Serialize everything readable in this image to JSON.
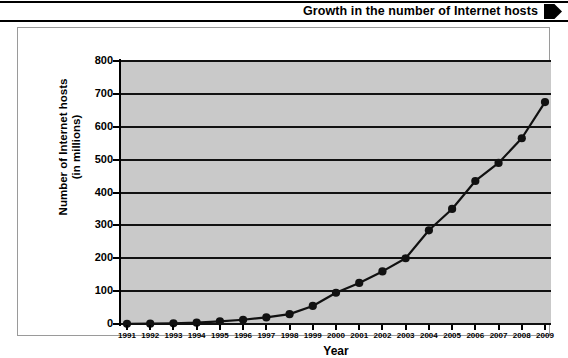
{
  "title": {
    "text": "Growth in the number of Internet hosts",
    "arrow_icon": "right-arrow-marker"
  },
  "chart_data": {
    "type": "line",
    "title": "Growth in the number of Internet hosts",
    "xlabel": "Year",
    "ylabel": "Number of Internet hosts (in millions)",
    "ylabel_line1": "Number of Internet hosts",
    "ylabel_line2": "(in millions)",
    "categories": [
      "1991",
      "1992",
      "1993",
      "1994",
      "1995",
      "1996",
      "1997",
      "1998",
      "1999",
      "2000",
      "2001",
      "2002",
      "2003",
      "2004",
      "2005",
      "2006",
      "2007",
      "2008",
      "2009"
    ],
    "values": [
      0.6,
      1,
      2,
      4,
      8,
      13,
      20,
      30,
      55,
      95,
      125,
      160,
      200,
      285,
      350,
      435,
      490,
      565,
      675
    ],
    "yticks": [
      0,
      100,
      200,
      300,
      400,
      500,
      600,
      700,
      800
    ],
    "ytick_labels": [
      "0",
      "100",
      "200",
      "300",
      "400",
      "500",
      "600",
      "700",
      "800"
    ],
    "ylim": [
      0,
      800
    ],
    "grid": true,
    "legend": "none",
    "marker": "filled-circle",
    "line_color": "#111111",
    "marker_color": "#111111",
    "plot_background": "#c9c9c9",
    "figure_background": "#ffffff"
  }
}
